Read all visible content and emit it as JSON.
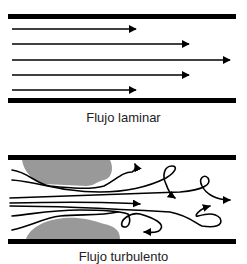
{
  "diagram": {
    "colors": {
      "line": "#000000",
      "deposit": "#999999",
      "background": "#ffffff"
    },
    "laminar": {
      "caption": "Flujo laminar",
      "arrows_relative_length": [
        0.55,
        0.78,
        1.0,
        0.78,
        0.55
      ]
    },
    "turbulent": {
      "caption": "Flujo turbulento",
      "has_deposits": true
    }
  }
}
